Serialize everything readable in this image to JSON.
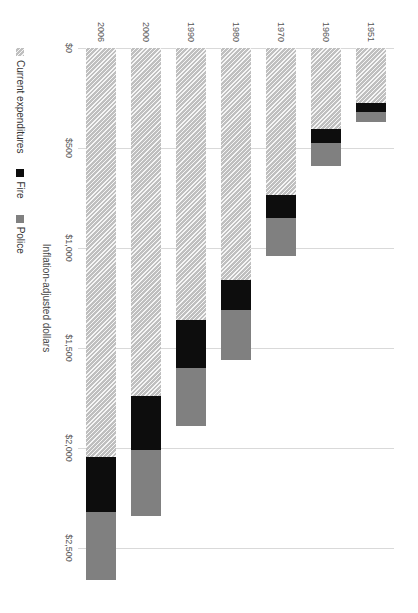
{
  "chart_data": {
    "type": "bar",
    "orientation": "horizontal-stacked",
    "title": "",
    "xlabel": "Inflation-adjusted dollars",
    "ylabel": "",
    "xlim": [
      0,
      2500
    ],
    "grid": true,
    "legend_position": "bottom",
    "categories": [
      "1951",
      "1960",
      "1970",
      "1980",
      "1990",
      "2000",
      "2006"
    ],
    "tick_labels": [
      "$0",
      "$500",
      "$1,000",
      "$1,500",
      "$2,000",
      "$2,500"
    ],
    "tick_values": [
      0,
      500,
      1000,
      1500,
      2000,
      2500
    ],
    "series": [
      {
        "name": "Current expenditures",
        "color": "#bfbfbf",
        "pattern": "hatched",
        "values": [
          275,
          405,
          735,
          1158,
          1360,
          1738,
          2043
        ]
      },
      {
        "name": "Fire",
        "color": "#0d0d0d",
        "pattern": "solid",
        "values": [
          45,
          70,
          115,
          152,
          240,
          272,
          277
        ]
      },
      {
        "name": "Police",
        "color": "#808080",
        "pattern": "solid",
        "values": [
          50,
          115,
          190,
          250,
          290,
          330,
          340
        ]
      }
    ],
    "totals": [
      370,
      590,
      1040,
      1560,
      1890,
      2340,
      2660
    ]
  },
  "axis": {
    "value_title": "Inflation-adjusted dollars"
  },
  "legend": {
    "items": [
      {
        "label": "Current expenditures",
        "swatch": "current"
      },
      {
        "label": "Fire",
        "swatch": "fire"
      },
      {
        "label": "Police",
        "swatch": "police"
      }
    ]
  }
}
